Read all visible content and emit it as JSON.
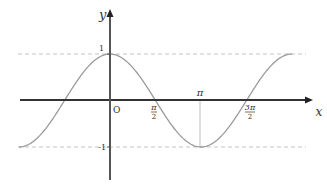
{
  "chart_data": {
    "type": "line",
    "title": "",
    "function": "y = cos x",
    "xlabel": "x",
    "ylabel": "y",
    "xlim": [
      -3.14159,
      6.28318
    ],
    "ylim": [
      -1,
      1
    ],
    "grid": false,
    "legend": null,
    "x_ticks": [
      {
        "value": 1.5708,
        "label": "π/2"
      },
      {
        "value": 3.14159,
        "label": "π"
      },
      {
        "value": 4.71239,
        "label": "3π/2"
      }
    ],
    "y_ticks": [
      {
        "value": 1,
        "label": "1"
      },
      {
        "value": -1,
        "label": "-1"
      }
    ],
    "origin_label": "O",
    "reference_lines": [
      {
        "type": "horizontal",
        "y": 1,
        "style": "dashed"
      },
      {
        "type": "horizontal",
        "y": -1,
        "style": "dashed"
      },
      {
        "type": "vertical",
        "x": 3.14159,
        "from_y": 0,
        "to_y": -1,
        "style": "solid-thin"
      }
    ],
    "series": [
      {
        "name": "cos x",
        "x": [
          -3.14159,
          -1.5708,
          0,
          1.5708,
          3.14159,
          4.71239,
          6.28318
        ],
        "values": [
          -1,
          0,
          1,
          0,
          -1,
          0,
          1
        ]
      }
    ]
  },
  "labels": {
    "x_axis": "x",
    "y_axis": "y",
    "origin": "O",
    "y_one": "1",
    "y_neg_one": "-1",
    "pi": "π",
    "half_pi_num": "π",
    "half_pi_den": "2",
    "three_half_pi_num": "3π",
    "three_half_pi_den": "2"
  },
  "colors": {
    "axis": "#333333",
    "curve": "#9a9a9a",
    "dashed": "#c4c4c4",
    "background": "#ffffff"
  }
}
